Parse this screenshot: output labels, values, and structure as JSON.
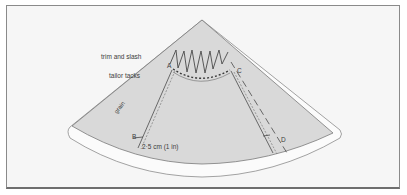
{
  "diagram": {
    "labels": {
      "trim_and_slash": "trim and slash",
      "tailor_tacks": "tailor tacks",
      "grain": "grain",
      "measurement": "2·5 cm (1 in)"
    },
    "points": {
      "A": "A",
      "B": "B",
      "C": "C",
      "D": "D"
    },
    "colors": {
      "background": "#f6f6f6",
      "fabric": "#d9d9d9",
      "rim": "#fbfbfb",
      "line": "#4a4a4a"
    }
  }
}
